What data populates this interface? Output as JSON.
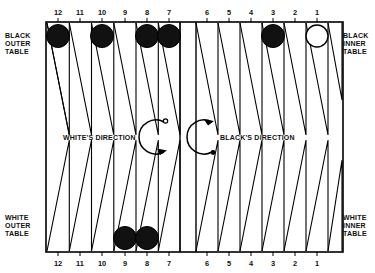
{
  "figure": {
    "background_color": "#ffffff",
    "line_color": "#000000",
    "checker_black_color": "#111111",
    "checker_white_color": "#ffffff"
  },
  "corner_labels": {
    "top_left": "BLACK\nOUTER\nTABLE",
    "top_right": "BLACK\nINNER\nTABLE",
    "bottom_left": "WHITE\nOUTER\nTABLE",
    "bottom_right": "WHITE\nINNER\nTABLE"
  },
  "direction_labels": {
    "white": "WHITE'S DIRECTION",
    "black": "BLACK'S DIRECTION"
  },
  "point_numbers": {
    "top_left_quadrant": [
      "12",
      "11",
      "10",
      "9",
      "8",
      "7"
    ],
    "top_right_quadrant": [
      "6",
      "5",
      "4",
      "3",
      "2",
      "1"
    ],
    "bottom_left_quadrant": [
      "12",
      "11",
      "10",
      "9",
      "8",
      "7"
    ],
    "bottom_right_quadrant": [
      "6",
      "5",
      "4",
      "3",
      "2",
      "1"
    ]
  },
  "checkers": {
    "top_left_quadrant": [
      {
        "point": "12",
        "color": "black"
      },
      {
        "point": "10",
        "color": "black"
      },
      {
        "point": "8",
        "color": "black"
      },
      {
        "point": "7",
        "color": "black"
      }
    ],
    "top_right_quadrant": [
      {
        "point": "3",
        "color": "black"
      },
      {
        "point": "1",
        "color": "white"
      }
    ],
    "bottom_left_quadrant": [
      {
        "point": "9",
        "color": "black"
      },
      {
        "point": "8",
        "color": "black"
      }
    ],
    "bottom_right_quadrant": []
  }
}
